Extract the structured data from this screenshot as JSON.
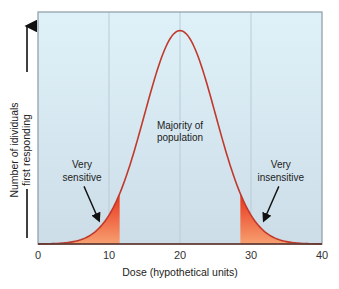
{
  "chart_data": {
    "type": "area",
    "title": "",
    "xlabel": "Dose (hypothetical units)",
    "ylabel_lines": [
      "Number of idividuals",
      "first responding"
    ],
    "xlim": [
      0,
      40
    ],
    "ylim": [
      0,
      1
    ],
    "xticks": [
      0,
      10,
      20,
      30,
      40
    ],
    "xtick_labels": [
      "0",
      "10",
      "20",
      "30",
      "40"
    ],
    "grid": "vertical",
    "distribution": {
      "kind": "normal",
      "mean": 20,
      "sd": 5,
      "peak_relative_height": 0.92
    },
    "shaded_regions": [
      {
        "name": "very-sensitive",
        "from": 0,
        "to": 11.5
      },
      {
        "name": "very-insensitive",
        "from": 28.5,
        "to": 40
      }
    ],
    "annotations": [
      {
        "name": "majority-label",
        "lines": [
          "Majority of",
          "population"
        ],
        "x": 20,
        "y": 0.47
      },
      {
        "name": "very-sensitive-label",
        "lines": [
          "Very",
          "sensitive"
        ],
        "x": 6.2,
        "y": 0.3,
        "arrow_to": [
          8.6,
          0.1
        ]
      },
      {
        "name": "very-insensitive-label",
        "lines": [
          "Very",
          "insensitive"
        ],
        "x": 34.2,
        "y": 0.3,
        "arrow_to": [
          31.8,
          0.1
        ]
      }
    ],
    "colors": {
      "plot_bg_top": "#dff1f8",
      "plot_bg_bottom": "#ccdde8",
      "curve": "#c0392b",
      "fill_top": "#e8321a",
      "fill_bottom": "#f7a070",
      "gridline": "#b9cbd6",
      "frame": "#8c9aa3"
    }
  }
}
